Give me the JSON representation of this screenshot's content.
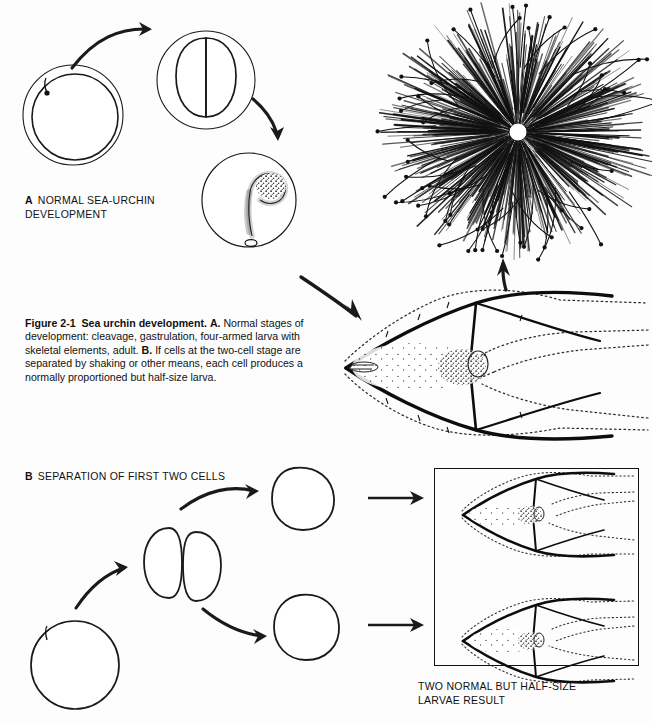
{
  "figure": {
    "number": "Figure 2-1",
    "title": "Sea urchin development.",
    "body_a_key": "A.",
    "body_a": "Normal stages of development: cleavage, gastrulation, four-armed larva with skeletal elements, adult.",
    "body_b_key": "B.",
    "body_b": "If cells at the two-cell stage are separated by shaking or other means, each cell produces a normally proportioned but half-size larva."
  },
  "panels": {
    "a": {
      "key": "A",
      "label": "NORMAL SEA-URCHIN\nDEVELOPMENT"
    },
    "b": {
      "key": "B",
      "label": "SEPARATION OF FIRST TWO CELLS"
    }
  },
  "result": {
    "label": "TWO NORMAL BUT HALF-SIZE\nLARVAE RESULT"
  },
  "stages": {
    "fertilized_egg": "fertilized-egg-with-envelope",
    "two_cell": "two-cell-stage-with-envelope",
    "gastrula": "gastrula-with-archenteron",
    "pluteus": "four-armed-pluteus-larva",
    "adult": "adult-sea-urchin",
    "egg_b": "egg",
    "two_cell_b": "two-cell-stage",
    "blastomere_top": "separated-blastomere-upper",
    "blastomere_bottom": "separated-blastomere-lower",
    "half_larva_top": "half-size-pluteus-larva-upper",
    "half_larva_bottom": "half-size-pluteus-larva-lower"
  },
  "arrows": {
    "a1": "curved-arrow-egg-to-two-cell",
    "a2": "curved-arrow-two-cell-to-gastrula",
    "a3": "curved-arrow-gastrula-to-larva",
    "a4": "arrow-larva-to-adult",
    "b1": "curved-arrow-egg-to-two-cell",
    "b2": "curved-arrow-two-cell-to-upper-blastomere",
    "b3": "curved-arrow-two-cell-to-lower-blastomere",
    "b4": "straight-arrow-to-upper-larva",
    "b5": "straight-arrow-to-lower-larva"
  },
  "colors": {
    "ink": "#111111",
    "paper": "#fdfdfd"
  }
}
